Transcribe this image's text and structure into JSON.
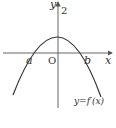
{
  "diagram": {
    "type": "function-graph",
    "axes": {
      "x_label": "x",
      "y_label": "y",
      "origin_label": "O"
    },
    "curve": {
      "label": "y=f′(x)",
      "shape": "downward-opening parabola",
      "y_intercept_label": "2",
      "roots": [
        "a",
        "b"
      ]
    },
    "colors": {
      "stroke": "#333333",
      "axis": "#555555",
      "background": "#ffffff"
    }
  }
}
